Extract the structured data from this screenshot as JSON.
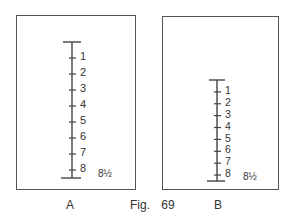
{
  "figure": {
    "caption_prefix": "Fig.",
    "caption_number": "69"
  },
  "panels": [
    {
      "label": "A",
      "marks": [
        "1",
        "2",
        "3",
        "4",
        "5",
        "6",
        "7",
        "8"
      ],
      "end_label": "8½",
      "description": "Tall scale spanning most of panel height"
    },
    {
      "label": "B",
      "marks": [
        "1",
        "2",
        "3",
        "4",
        "5",
        "6",
        "7",
        "8"
      ],
      "end_label": "8½",
      "description": "Compressed scale in lower portion of panel"
    }
  ],
  "colors": {
    "line": "#444444",
    "text": "#333333",
    "border": "#555555"
  }
}
